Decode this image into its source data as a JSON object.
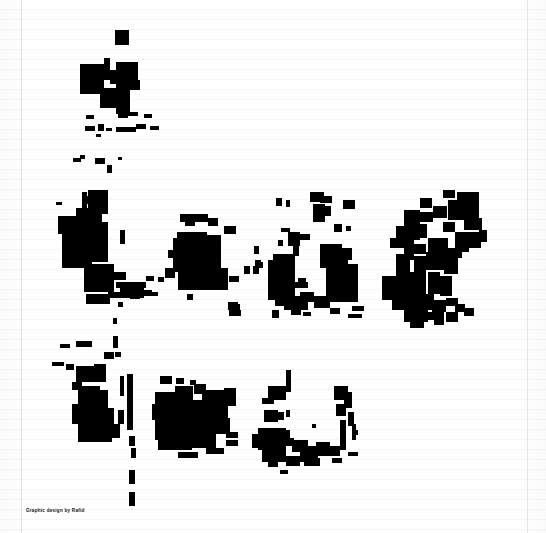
{
  "page": {
    "width": 546,
    "height": 533,
    "background_color": "#ffffff",
    "ink_color": "#000000",
    "rule_color": "#f2f2f4",
    "border_color": "#e3e3e6"
  },
  "caption": {
    "text": "Graphic design by Rafid"
  },
  "artwork": {
    "title": "ink-blob-composition",
    "rows": [
      {
        "name": "row-top",
        "label": "top cluster"
      },
      {
        "name": "row-middle",
        "label": "middle cluster band"
      },
      {
        "name": "row-bottom",
        "label": "bottom cluster band"
      }
    ],
    "shapes": [
      {
        "x": 115,
        "y": 30,
        "w": 14,
        "h": 15
      },
      {
        "x": 80,
        "y": 64,
        "w": 24,
        "h": 30
      },
      {
        "x": 104,
        "y": 58,
        "w": 6,
        "h": 22
      },
      {
        "x": 110,
        "y": 70,
        "w": 6,
        "h": 14
      },
      {
        "x": 116,
        "y": 62,
        "w": 22,
        "h": 18
      },
      {
        "x": 116,
        "y": 80,
        "w": 14,
        "h": 34
      },
      {
        "x": 130,
        "y": 80,
        "w": 10,
        "h": 10
      },
      {
        "x": 100,
        "y": 88,
        "w": 18,
        "h": 20
      },
      {
        "x": 118,
        "y": 108,
        "w": 10,
        "h": 10
      },
      {
        "x": 86,
        "y": 115,
        "w": 8,
        "h": 4
      },
      {
        "x": 126,
        "y": 112,
        "w": 12,
        "h": 4
      },
      {
        "x": 144,
        "y": 114,
        "w": 8,
        "h": 4
      },
      {
        "x": 85,
        "y": 126,
        "w": 10,
        "h": 5
      },
      {
        "x": 98,
        "y": 124,
        "w": 6,
        "h": 7
      },
      {
        "x": 106,
        "y": 128,
        "w": 6,
        "h": 3
      },
      {
        "x": 116,
        "y": 127,
        "w": 20,
        "h": 5
      },
      {
        "x": 136,
        "y": 124,
        "w": 10,
        "h": 5
      },
      {
        "x": 150,
        "y": 126,
        "w": 9,
        "h": 4
      },
      {
        "x": 96,
        "y": 134,
        "w": 5,
        "h": 3
      },
      {
        "x": 73,
        "y": 158,
        "w": 8,
        "h": 4
      },
      {
        "x": 80,
        "y": 155,
        "w": 5,
        "h": 4
      },
      {
        "x": 95,
        "y": 158,
        "w": 10,
        "h": 6
      },
      {
        "x": 107,
        "y": 165,
        "w": 5,
        "h": 8
      },
      {
        "x": 118,
        "y": 157,
        "w": 4,
        "h": 3
      },
      {
        "x": 82,
        "y": 192,
        "w": 5,
        "h": 16
      },
      {
        "x": 56,
        "y": 202,
        "w": 6,
        "h": 3
      },
      {
        "x": 88,
        "y": 190,
        "w": 20,
        "h": 24
      },
      {
        "x": 85,
        "y": 196,
        "w": 9,
        "h": 8
      },
      {
        "x": 58,
        "y": 216,
        "w": 18,
        "h": 18
      },
      {
        "x": 76,
        "y": 208,
        "w": 26,
        "h": 26
      },
      {
        "x": 92,
        "y": 212,
        "w": 9,
        "h": 6
      },
      {
        "x": 62,
        "y": 228,
        "w": 26,
        "h": 24
      },
      {
        "x": 88,
        "y": 222,
        "w": 20,
        "h": 30
      },
      {
        "x": 95,
        "y": 232,
        "w": 8,
        "h": 9
      },
      {
        "x": 120,
        "y": 230,
        "w": 5,
        "h": 14
      },
      {
        "x": 62,
        "y": 250,
        "w": 30,
        "h": 18
      },
      {
        "x": 90,
        "y": 248,
        "w": 18,
        "h": 14
      },
      {
        "x": 84,
        "y": 264,
        "w": 30,
        "h": 28
      },
      {
        "x": 112,
        "y": 272,
        "w": 14,
        "h": 8
      },
      {
        "x": 116,
        "y": 282,
        "w": 30,
        "h": 6
      },
      {
        "x": 120,
        "y": 288,
        "w": 24,
        "h": 10
      },
      {
        "x": 146,
        "y": 276,
        "w": 8,
        "h": 5
      },
      {
        "x": 158,
        "y": 277,
        "w": 6,
        "h": 5
      },
      {
        "x": 108,
        "y": 292,
        "w": 14,
        "h": 6
      },
      {
        "x": 130,
        "y": 294,
        "w": 10,
        "h": 5
      },
      {
        "x": 140,
        "y": 290,
        "w": 12,
        "h": 6
      },
      {
        "x": 152,
        "y": 292,
        "w": 6,
        "h": 4
      },
      {
        "x": 86,
        "y": 294,
        "w": 24,
        "h": 10
      },
      {
        "x": 118,
        "y": 302,
        "w": 5,
        "h": 5
      },
      {
        "x": 113,
        "y": 318,
        "w": 4,
        "h": 6
      },
      {
        "x": 180,
        "y": 214,
        "w": 28,
        "h": 8
      },
      {
        "x": 185,
        "y": 222,
        "w": 10,
        "h": 4
      },
      {
        "x": 208,
        "y": 218,
        "w": 10,
        "h": 8
      },
      {
        "x": 224,
        "y": 226,
        "w": 12,
        "h": 8
      },
      {
        "x": 177,
        "y": 232,
        "w": 30,
        "h": 8
      },
      {
        "x": 173,
        "y": 238,
        "w": 48,
        "h": 34
      },
      {
        "x": 205,
        "y": 235,
        "w": 16,
        "h": 24
      },
      {
        "x": 178,
        "y": 268,
        "w": 50,
        "h": 22
      },
      {
        "x": 211,
        "y": 258,
        "w": 10,
        "h": 10
      },
      {
        "x": 168,
        "y": 250,
        "w": 8,
        "h": 8
      },
      {
        "x": 165,
        "y": 268,
        "w": 10,
        "h": 10
      },
      {
        "x": 244,
        "y": 266,
        "w": 6,
        "h": 8
      },
      {
        "x": 253,
        "y": 266,
        "w": 6,
        "h": 8
      },
      {
        "x": 229,
        "y": 276,
        "w": 10,
        "h": 6
      },
      {
        "x": 187,
        "y": 294,
        "w": 6,
        "h": 6
      },
      {
        "x": 228,
        "y": 304,
        "w": 12,
        "h": 6
      },
      {
        "x": 229,
        "y": 310,
        "w": 12,
        "h": 6
      },
      {
        "x": 276,
        "y": 198,
        "w": 6,
        "h": 8
      },
      {
        "x": 286,
        "y": 200,
        "w": 4,
        "h": 7
      },
      {
        "x": 310,
        "y": 192,
        "w": 14,
        "h": 10
      },
      {
        "x": 320,
        "y": 196,
        "w": 12,
        "h": 7
      },
      {
        "x": 343,
        "y": 200,
        "w": 12,
        "h": 9
      },
      {
        "x": 313,
        "y": 204,
        "w": 12,
        "h": 18
      },
      {
        "x": 325,
        "y": 206,
        "w": 6,
        "h": 10
      },
      {
        "x": 334,
        "y": 224,
        "w": 8,
        "h": 8
      },
      {
        "x": 346,
        "y": 226,
        "w": 5,
        "h": 5
      },
      {
        "x": 281,
        "y": 228,
        "w": 9,
        "h": 4
      },
      {
        "x": 288,
        "y": 232,
        "w": 12,
        "h": 14
      },
      {
        "x": 300,
        "y": 234,
        "w": 10,
        "h": 6
      },
      {
        "x": 293,
        "y": 246,
        "w": 6,
        "h": 10
      },
      {
        "x": 254,
        "y": 246,
        "w": 5,
        "h": 8
      },
      {
        "x": 255,
        "y": 260,
        "w": 6,
        "h": 6
      },
      {
        "x": 278,
        "y": 240,
        "w": 5,
        "h": 6
      },
      {
        "x": 320,
        "y": 244,
        "w": 22,
        "h": 24
      },
      {
        "x": 332,
        "y": 252,
        "w": 16,
        "h": 14
      },
      {
        "x": 326,
        "y": 264,
        "w": 32,
        "h": 38
      },
      {
        "x": 340,
        "y": 248,
        "w": 12,
        "h": 12
      },
      {
        "x": 273,
        "y": 254,
        "w": 22,
        "h": 46
      },
      {
        "x": 268,
        "y": 260,
        "w": 8,
        "h": 40
      },
      {
        "x": 281,
        "y": 256,
        "w": 9,
        "h": 38
      },
      {
        "x": 255,
        "y": 262,
        "w": 8,
        "h": 6
      },
      {
        "x": 298,
        "y": 278,
        "w": 8,
        "h": 5
      },
      {
        "x": 288,
        "y": 282,
        "w": 20,
        "h": 6
      },
      {
        "x": 275,
        "y": 296,
        "w": 10,
        "h": 10
      },
      {
        "x": 284,
        "y": 296,
        "w": 24,
        "h": 14
      },
      {
        "x": 300,
        "y": 292,
        "w": 14,
        "h": 10
      },
      {
        "x": 314,
        "y": 296,
        "w": 16,
        "h": 12
      },
      {
        "x": 272,
        "y": 310,
        "w": 7,
        "h": 8
      },
      {
        "x": 291,
        "y": 310,
        "w": 10,
        "h": 5
      },
      {
        "x": 303,
        "y": 312,
        "w": 8,
        "h": 4
      },
      {
        "x": 330,
        "y": 308,
        "w": 10,
        "h": 6
      },
      {
        "x": 352,
        "y": 306,
        "w": 12,
        "h": 5
      },
      {
        "x": 348,
        "y": 314,
        "w": 14,
        "h": 4
      },
      {
        "x": 228,
        "y": 302,
        "w": 10,
        "h": 5
      },
      {
        "x": 443,
        "y": 190,
        "w": 12,
        "h": 8
      },
      {
        "x": 457,
        "y": 192,
        "w": 22,
        "h": 28
      },
      {
        "x": 448,
        "y": 200,
        "w": 14,
        "h": 20
      },
      {
        "x": 420,
        "y": 198,
        "w": 12,
        "h": 10
      },
      {
        "x": 404,
        "y": 210,
        "w": 16,
        "h": 16
      },
      {
        "x": 419,
        "y": 212,
        "w": 14,
        "h": 10
      },
      {
        "x": 433,
        "y": 206,
        "w": 14,
        "h": 12
      },
      {
        "x": 396,
        "y": 226,
        "w": 24,
        "h": 14
      },
      {
        "x": 417,
        "y": 224,
        "w": 10,
        "h": 14
      },
      {
        "x": 443,
        "y": 222,
        "w": 12,
        "h": 10
      },
      {
        "x": 464,
        "y": 218,
        "w": 18,
        "h": 12
      },
      {
        "x": 455,
        "y": 232,
        "w": 26,
        "h": 16
      },
      {
        "x": 479,
        "y": 230,
        "w": 8,
        "h": 12
      },
      {
        "x": 390,
        "y": 238,
        "w": 22,
        "h": 10
      },
      {
        "x": 404,
        "y": 234,
        "w": 10,
        "h": 26
      },
      {
        "x": 412,
        "y": 244,
        "w": 14,
        "h": 10
      },
      {
        "x": 428,
        "y": 238,
        "w": 20,
        "h": 22
      },
      {
        "x": 448,
        "y": 248,
        "w": 14,
        "h": 10
      },
      {
        "x": 461,
        "y": 244,
        "w": 8,
        "h": 8
      },
      {
        "x": 396,
        "y": 254,
        "w": 14,
        "h": 24
      },
      {
        "x": 414,
        "y": 256,
        "w": 12,
        "h": 28
      },
      {
        "x": 426,
        "y": 252,
        "w": 18,
        "h": 18
      },
      {
        "x": 444,
        "y": 258,
        "w": 14,
        "h": 16
      },
      {
        "x": 382,
        "y": 276,
        "w": 26,
        "h": 24
      },
      {
        "x": 406,
        "y": 272,
        "w": 20,
        "h": 30
      },
      {
        "x": 428,
        "y": 272,
        "w": 12,
        "h": 22
      },
      {
        "x": 440,
        "y": 276,
        "w": 12,
        "h": 20
      },
      {
        "x": 392,
        "y": 298,
        "w": 24,
        "h": 12
      },
      {
        "x": 414,
        "y": 294,
        "w": 20,
        "h": 16
      },
      {
        "x": 432,
        "y": 300,
        "w": 14,
        "h": 12
      },
      {
        "x": 446,
        "y": 298,
        "w": 12,
        "h": 8
      },
      {
        "x": 455,
        "y": 304,
        "w": 10,
        "h": 8
      },
      {
        "x": 404,
        "y": 310,
        "w": 24,
        "h": 12
      },
      {
        "x": 428,
        "y": 312,
        "w": 16,
        "h": 8
      },
      {
        "x": 446,
        "y": 312,
        "w": 12,
        "h": 10
      },
      {
        "x": 464,
        "y": 308,
        "w": 10,
        "h": 8
      },
      {
        "x": 410,
        "y": 322,
        "w": 14,
        "h": 6
      },
      {
        "x": 434,
        "y": 320,
        "w": 10,
        "h": 5
      },
      {
        "x": 60,
        "y": 344,
        "w": 10,
        "h": 4
      },
      {
        "x": 76,
        "y": 341,
        "w": 16,
        "h": 6
      },
      {
        "x": 113,
        "y": 336,
        "w": 5,
        "h": 12
      },
      {
        "x": 104,
        "y": 352,
        "w": 10,
        "h": 7
      },
      {
        "x": 115,
        "y": 352,
        "w": 6,
        "h": 5
      },
      {
        "x": 52,
        "y": 362,
        "w": 12,
        "h": 4
      },
      {
        "x": 66,
        "y": 364,
        "w": 8,
        "h": 6
      },
      {
        "x": 76,
        "y": 366,
        "w": 22,
        "h": 16
      },
      {
        "x": 94,
        "y": 364,
        "w": 12,
        "h": 18
      },
      {
        "x": 127,
        "y": 374,
        "w": 6,
        "h": 56
      },
      {
        "x": 120,
        "y": 376,
        "w": 4,
        "h": 20
      },
      {
        "x": 72,
        "y": 382,
        "w": 10,
        "h": 8
      },
      {
        "x": 78,
        "y": 386,
        "w": 22,
        "h": 22
      },
      {
        "x": 96,
        "y": 390,
        "w": 12,
        "h": 18
      },
      {
        "x": 72,
        "y": 404,
        "w": 26,
        "h": 20
      },
      {
        "x": 94,
        "y": 408,
        "w": 20,
        "h": 16
      },
      {
        "x": 78,
        "y": 418,
        "w": 34,
        "h": 24
      },
      {
        "x": 112,
        "y": 424,
        "w": 8,
        "h": 14
      },
      {
        "x": 118,
        "y": 410,
        "w": 6,
        "h": 14
      },
      {
        "x": 129,
        "y": 436,
        "w": 6,
        "h": 10
      },
      {
        "x": 131,
        "y": 448,
        "w": 5,
        "h": 10
      },
      {
        "x": 129,
        "y": 470,
        "w": 6,
        "h": 14
      },
      {
        "x": 129,
        "y": 492,
        "w": 6,
        "h": 14
      },
      {
        "x": 160,
        "y": 376,
        "w": 12,
        "h": 8
      },
      {
        "x": 176,
        "y": 378,
        "w": 8,
        "h": 6
      },
      {
        "x": 190,
        "y": 380,
        "w": 6,
        "h": 5
      },
      {
        "x": 155,
        "y": 392,
        "w": 22,
        "h": 18
      },
      {
        "x": 175,
        "y": 386,
        "w": 18,
        "h": 24
      },
      {
        "x": 194,
        "y": 384,
        "w": 12,
        "h": 10
      },
      {
        "x": 202,
        "y": 390,
        "w": 24,
        "h": 22
      },
      {
        "x": 224,
        "y": 388,
        "w": 12,
        "h": 18
      },
      {
        "x": 152,
        "y": 404,
        "w": 34,
        "h": 16
      },
      {
        "x": 186,
        "y": 400,
        "w": 22,
        "h": 24
      },
      {
        "x": 208,
        "y": 406,
        "w": 20,
        "h": 20
      },
      {
        "x": 155,
        "y": 418,
        "w": 36,
        "h": 22
      },
      {
        "x": 190,
        "y": 420,
        "w": 26,
        "h": 18
      },
      {
        "x": 216,
        "y": 418,
        "w": 14,
        "h": 16
      },
      {
        "x": 158,
        "y": 438,
        "w": 34,
        "h": 12
      },
      {
        "x": 192,
        "y": 438,
        "w": 24,
        "h": 10
      },
      {
        "x": 206,
        "y": 448,
        "w": 18,
        "h": 6
      },
      {
        "x": 178,
        "y": 452,
        "w": 20,
        "h": 6
      },
      {
        "x": 226,
        "y": 432,
        "w": 12,
        "h": 6
      },
      {
        "x": 226,
        "y": 440,
        "w": 12,
        "h": 6
      },
      {
        "x": 286,
        "y": 370,
        "w": 5,
        "h": 22
      },
      {
        "x": 268,
        "y": 386,
        "w": 18,
        "h": 14
      },
      {
        "x": 262,
        "y": 398,
        "w": 12,
        "h": 6
      },
      {
        "x": 264,
        "y": 410,
        "w": 14,
        "h": 12
      },
      {
        "x": 276,
        "y": 412,
        "w": 8,
        "h": 8
      },
      {
        "x": 286,
        "y": 410,
        "w": 4,
        "h": 7
      },
      {
        "x": 334,
        "y": 386,
        "w": 14,
        "h": 14
      },
      {
        "x": 344,
        "y": 392,
        "w": 8,
        "h": 16
      },
      {
        "x": 336,
        "y": 404,
        "w": 10,
        "h": 12
      },
      {
        "x": 348,
        "y": 412,
        "w": 6,
        "h": 14
      },
      {
        "x": 340,
        "y": 420,
        "w": 6,
        "h": 30
      },
      {
        "x": 352,
        "y": 424,
        "w": 4,
        "h": 16
      },
      {
        "x": 258,
        "y": 428,
        "w": 28,
        "h": 22
      },
      {
        "x": 252,
        "y": 434,
        "w": 14,
        "h": 14
      },
      {
        "x": 278,
        "y": 430,
        "w": 12,
        "h": 10
      },
      {
        "x": 284,
        "y": 438,
        "w": 10,
        "h": 8
      },
      {
        "x": 262,
        "y": 448,
        "w": 24,
        "h": 14
      },
      {
        "x": 292,
        "y": 440,
        "w": 16,
        "h": 12
      },
      {
        "x": 300,
        "y": 446,
        "w": 18,
        "h": 16
      },
      {
        "x": 316,
        "y": 442,
        "w": 14,
        "h": 14
      },
      {
        "x": 328,
        "y": 446,
        "w": 12,
        "h": 10
      },
      {
        "x": 286,
        "y": 456,
        "w": 14,
        "h": 10
      },
      {
        "x": 304,
        "y": 458,
        "w": 16,
        "h": 8
      },
      {
        "x": 268,
        "y": 462,
        "w": 10,
        "h": 5
      },
      {
        "x": 332,
        "y": 458,
        "w": 10,
        "h": 5
      },
      {
        "x": 348,
        "y": 452,
        "w": 10,
        "h": 4
      },
      {
        "x": 280,
        "y": 470,
        "w": 8,
        "h": 4
      },
      {
        "x": 312,
        "y": 424,
        "w": 4,
        "h": 4
      },
      {
        "x": 352,
        "y": 430,
        "w": 6,
        "h": 5
      }
    ]
  }
}
